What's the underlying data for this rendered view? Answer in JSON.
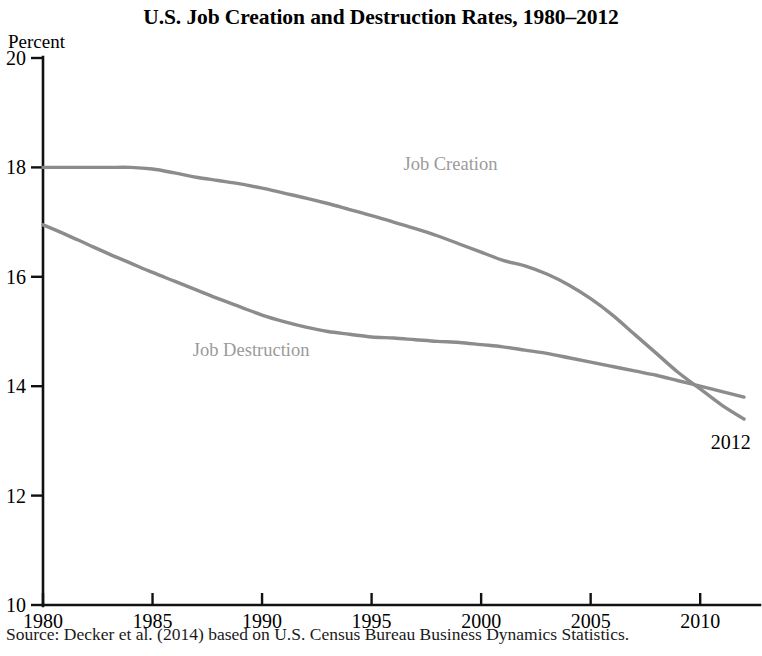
{
  "chart_data": {
    "type": "line",
    "title": "U.S. Job Creation and Destruction Rates, 1980–2012",
    "xlabel": "",
    "ylabel": "Percent",
    "xlim": [
      1980,
      2012
    ],
    "ylim": [
      10,
      20
    ],
    "xticks": [
      1980,
      1985,
      1990,
      1995,
      2000,
      2005,
      2010
    ],
    "yticks": [
      10,
      12,
      14,
      16,
      18,
      20
    ],
    "xtick_labels": [
      "1980",
      "1985",
      "1990",
      "1995",
      "2000",
      "2005",
      "2010"
    ],
    "ytick_labels": [
      "10",
      "12",
      "14",
      "16",
      "18",
      "20"
    ],
    "grid": false,
    "legend_position": "inline-annotations",
    "line_color": "#8c8c8c",
    "axis_color": "#111111",
    "series": [
      {
        "name": "Job Creation",
        "label_x": 1998.6,
        "label_y": 17.95,
        "x": [
          1980,
          1981,
          1982,
          1983,
          1984,
          1985,
          1986,
          1987,
          1988,
          1989,
          1990,
          1991,
          1992,
          1993,
          1994,
          1995,
          1996,
          1997,
          1998,
          1999,
          2000,
          2001,
          2002,
          2003,
          2004,
          2005,
          2006,
          2007,
          2008,
          2009,
          2010,
          2011,
          2012
        ],
        "values": [
          18.0,
          18.0,
          18.0,
          18.0,
          18.0,
          17.97,
          17.9,
          17.82,
          17.76,
          17.7,
          17.62,
          17.53,
          17.44,
          17.34,
          17.23,
          17.12,
          17.0,
          16.88,
          16.75,
          16.6,
          16.45,
          16.3,
          16.2,
          16.05,
          15.85,
          15.6,
          15.3,
          14.95,
          14.6,
          14.25,
          13.95,
          13.65,
          13.4
        ]
      },
      {
        "name": "Job Destruction",
        "label_x": 1989.5,
        "label_y": 14.55,
        "x": [
          1980,
          1981,
          1982,
          1983,
          1984,
          1985,
          1986,
          1987,
          1988,
          1989,
          1990,
          1991,
          1992,
          1993,
          1994,
          1995,
          1996,
          1997,
          1998,
          1999,
          2000,
          2001,
          2002,
          2003,
          2004,
          2005,
          2006,
          2007,
          2008,
          2009,
          2010,
          2011,
          2012
        ],
        "values": [
          16.95,
          16.78,
          16.6,
          16.42,
          16.25,
          16.08,
          15.92,
          15.76,
          15.6,
          15.45,
          15.3,
          15.18,
          15.08,
          15.0,
          14.95,
          14.9,
          14.88,
          14.85,
          14.82,
          14.8,
          14.76,
          14.72,
          14.66,
          14.6,
          14.52,
          14.44,
          14.36,
          14.28,
          14.2,
          14.1,
          14.0,
          13.9,
          13.8
        ]
      }
    ],
    "annotations": [
      {
        "text": "2012",
        "x": 2011.4,
        "y": 12.85
      }
    ]
  },
  "source_note": "Source: Decker et al. (2014) based on U.S. Census Bureau Business Dynamics Statistics."
}
